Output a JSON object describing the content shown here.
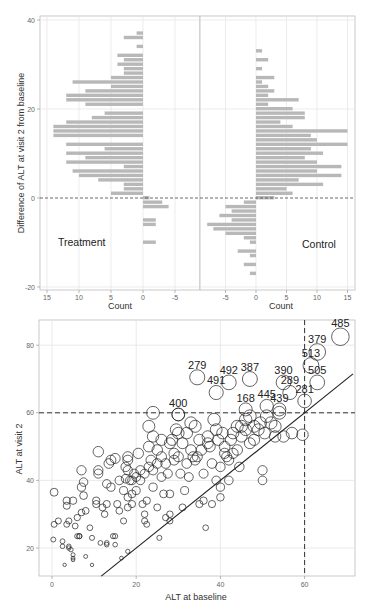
{
  "chart_data": [
    {
      "type": "bar",
      "orientation": "horizontal",
      "title": "",
      "panel_label": "Treatment",
      "xlabel": "Count",
      "ylabel": "Difference of ALT at visit 2 from baseline",
      "x_reversed": true,
      "xlim": [
        16,
        -8.5
      ],
      "ylim": [
        -20.5,
        41
      ],
      "xticks": [
        "15",
        "10",
        "5",
        "0",
        "-5"
      ],
      "yticks": [
        "-20",
        "0",
        "20",
        "40"
      ],
      "reference_line": {
        "y": 0,
        "style": "dashed"
      },
      "bins": [
        37,
        36,
        34,
        32,
        31,
        30,
        29,
        28,
        27,
        26,
        25,
        24,
        23,
        22,
        21,
        19,
        18,
        17,
        16,
        15,
        14,
        12,
        11,
        10,
        9,
        8,
        7,
        6,
        5,
        4,
        3,
        2,
        1,
        0,
        -1,
        -2,
        -5,
        -6,
        -10
      ],
      "values": [
        1,
        3,
        1,
        4,
        3,
        4,
        3,
        3,
        5,
        11,
        5,
        9,
        12,
        12,
        9,
        6,
        8,
        12,
        14,
        14,
        14,
        12,
        6,
        12,
        9,
        12,
        3,
        11,
        10,
        7,
        3,
        3,
        5,
        -1,
        -3,
        -4,
        -2,
        -2,
        -2
      ]
    },
    {
      "type": "bar",
      "orientation": "horizontal",
      "title": "",
      "panel_label": "Control",
      "xlabel": "Count",
      "ylabel": "",
      "xlim": [
        -9,
        16
      ],
      "ylim": [
        -20.5,
        41
      ],
      "xticks": [
        "-5",
        "0",
        "5",
        "10",
        "15"
      ],
      "reference_line": {
        "y": 0,
        "style": "dashed"
      },
      "bins": [
        33,
        31,
        29,
        27,
        26,
        25,
        24,
        23,
        22,
        21,
        20,
        19,
        18,
        17,
        16,
        15,
        14,
        13,
        12,
        11,
        10,
        9,
        8,
        7,
        6,
        5,
        4,
        3,
        2,
        1,
        0,
        -1,
        -2,
        -3,
        -4,
        -5,
        -6,
        -7,
        -8,
        -9,
        -10,
        -12,
        -13,
        -15,
        -17
      ],
      "values": [
        1,
        2,
        1,
        3,
        1,
        2,
        3,
        2,
        7,
        2,
        6,
        8,
        8,
        4,
        6,
        15,
        9,
        10,
        15,
        9,
        11,
        8,
        10,
        14,
        10,
        14,
        7,
        11,
        5,
        6,
        3,
        -2,
        -5,
        -4,
        -6,
        -4,
        -8,
        -7,
        -5,
        -2,
        -1,
        -3,
        -1,
        -2,
        -1
      ]
    },
    {
      "type": "scatter",
      "title": "",
      "xlabel": "ALT at baseline",
      "ylabel": "ALT at visit 2",
      "xlim": [
        -3,
        72
      ],
      "ylim": [
        11,
        87
      ],
      "xticks": [
        "0",
        "20",
        "40",
        "60"
      ],
      "yticks": [
        "20",
        "40",
        "60",
        "80"
      ],
      "grid": true,
      "marker": "open-circle, size proportional to ALT at visit 2",
      "reference_lines": [
        {
          "type": "hline",
          "y": 60,
          "style": "dashed"
        },
        {
          "type": "vline",
          "x": 60,
          "style": "dashed"
        },
        {
          "type": "abline",
          "slope": 1,
          "intercept": 0,
          "style": "solid"
        }
      ],
      "labeled_points": [
        {
          "id": "485",
          "x": 68.5,
          "y": 82.5
        },
        {
          "id": "379",
          "x": 63,
          "y": 78
        },
        {
          "id": "513",
          "x": 61.5,
          "y": 74
        },
        {
          "id": "505",
          "x": 63,
          "y": 69
        },
        {
          "id": "390",
          "x": 55,
          "y": 69
        },
        {
          "id": "387",
          "x": 47,
          "y": 70
        },
        {
          "id": "492",
          "x": 42,
          "y": 69
        },
        {
          "id": "279",
          "x": 34.5,
          "y": 70.5
        },
        {
          "id": "491",
          "x": 39,
          "y": 66
        },
        {
          "id": "289",
          "x": 56.5,
          "y": 66
        },
        {
          "id": "281",
          "x": 60,
          "y": 63.5
        },
        {
          "id": "400",
          "x": 30,
          "y": 59.5
        },
        {
          "id": "168",
          "x": 46,
          "y": 61
        },
        {
          "id": "439",
          "x": 54,
          "y": 61
        },
        {
          "id": "445",
          "x": 51,
          "y": 62
        }
      ],
      "points": [
        [
          0.5,
          36.5
        ],
        [
          0.5,
          27
        ],
        [
          0.3,
          22.5
        ],
        [
          1.5,
          28
        ],
        [
          2.5,
          20.5
        ],
        [
          2.5,
          22
        ],
        [
          3,
          15
        ],
        [
          3.5,
          34
        ],
        [
          3.5,
          32.5
        ],
        [
          3.5,
          27
        ],
        [
          4,
          28
        ],
        [
          4,
          20.5
        ],
        [
          4,
          20
        ],
        [
          4.5,
          19.5
        ],
        [
          5,
          34
        ],
        [
          5,
          18
        ],
        [
          5,
          16.5
        ],
        [
          5,
          17
        ],
        [
          5.5,
          26.5
        ],
        [
          6,
          23.5
        ],
        [
          6,
          29
        ],
        [
          6.5,
          23.5
        ],
        [
          6.5,
          23.5
        ],
        [
          7,
          38
        ],
        [
          7,
          43
        ],
        [
          7,
          30.5
        ],
        [
          7.5,
          39.5
        ],
        [
          7.5,
          35.5
        ],
        [
          8,
          31
        ],
        [
          8,
          17.5
        ],
        [
          9,
          26
        ],
        [
          9.5,
          23
        ],
        [
          9.5,
          15
        ],
        [
          10.5,
          33
        ],
        [
          10.5,
          34
        ],
        [
          11,
          43
        ],
        [
          11,
          42
        ],
        [
          11,
          48.5
        ],
        [
          11.5,
          21.5
        ],
        [
          12,
          32
        ],
        [
          12.5,
          30
        ],
        [
          13,
          21.5
        ],
        [
          13,
          21
        ],
        [
          13,
          33
        ],
        [
          13,
          39
        ],
        [
          13.5,
          45
        ],
        [
          14,
          46
        ],
        [
          14,
          38
        ],
        [
          14.5,
          23.5
        ],
        [
          15,
          21
        ],
        [
          15,
          46.5
        ],
        [
          15,
          23.5
        ],
        [
          15.5,
          33
        ],
        [
          16,
          40
        ],
        [
          16,
          31
        ],
        [
          16.5,
          17
        ],
        [
          17,
          37
        ],
        [
          17,
          28
        ],
        [
          17.5,
          40.5
        ],
        [
          17.5,
          44
        ],
        [
          18,
          46
        ],
        [
          18,
          47
        ],
        [
          18,
          43
        ],
        [
          18,
          19
        ],
        [
          18,
          35
        ],
        [
          18,
          32
        ],
        [
          18.5,
          40
        ],
        [
          19,
          40
        ],
        [
          19,
          36
        ],
        [
          19,
          33
        ],
        [
          19.5,
          42
        ],
        [
          20,
          41
        ],
        [
          20,
          37
        ],
        [
          20.5,
          48
        ],
        [
          21,
          40
        ],
        [
          21,
          43
        ],
        [
          21.5,
          33
        ],
        [
          22,
          42
        ],
        [
          22,
          28
        ],
        [
          22,
          30
        ],
        [
          22.5,
          34
        ],
        [
          22.5,
          27
        ],
        [
          23,
          56
        ],
        [
          23,
          50
        ],
        [
          23,
          44
        ],
        [
          23.5,
          46
        ],
        [
          24,
          60
        ],
        [
          24,
          53
        ],
        [
          24,
          38
        ],
        [
          24,
          43
        ],
        [
          25,
          49
        ],
        [
          25,
          45
        ],
        [
          25,
          32
        ],
        [
          25.5,
          23
        ],
        [
          26,
          41
        ],
        [
          26,
          52
        ],
        [
          26,
          47
        ],
        [
          26.5,
          36
        ],
        [
          27,
          29
        ],
        [
          27,
          45
        ],
        [
          27.5,
          42
        ],
        [
          28,
          51
        ],
        [
          28,
          36
        ],
        [
          28,
          30
        ],
        [
          28,
          28
        ],
        [
          28.5,
          52
        ],
        [
          29,
          46
        ],
        [
          29,
          48
        ],
        [
          29.5,
          55
        ],
        [
          30,
          59.5
        ],
        [
          30,
          54
        ],
        [
          30,
          47
        ],
        [
          30.5,
          42
        ],
        [
          31,
          32
        ],
        [
          31,
          51
        ],
        [
          31.5,
          37
        ],
        [
          32,
          54
        ],
        [
          32,
          45
        ],
        [
          32.5,
          41
        ],
        [
          33,
          57
        ],
        [
          33,
          49
        ],
        [
          33.5,
          47
        ],
        [
          34,
          56
        ],
        [
          34,
          46
        ],
        [
          34.5,
          47
        ],
        [
          35,
          52
        ],
        [
          35,
          33
        ],
        [
          35.5,
          49
        ],
        [
          36,
          42
        ],
        [
          36,
          34
        ],
        [
          36.5,
          26
        ],
        [
          37,
          51
        ],
        [
          37,
          53
        ],
        [
          37.5,
          50
        ],
        [
          38,
          45
        ],
        [
          38,
          33
        ],
        [
          38.5,
          58
        ],
        [
          39,
          55
        ],
        [
          39,
          40
        ],
        [
          39.5,
          52
        ],
        [
          40,
          44
        ],
        [
          40,
          38
        ],
        [
          40,
          35
        ],
        [
          40.5,
          54
        ],
        [
          41,
          48
        ],
        [
          41,
          50
        ],
        [
          41.5,
          47
        ],
        [
          42,
          46
        ],
        [
          42,
          40
        ],
        [
          42.5,
          52
        ],
        [
          43,
          54
        ],
        [
          43,
          48
        ],
        [
          44,
          56
        ],
        [
          44,
          49
        ],
        [
          44.5,
          44
        ],
        [
          45,
          56
        ],
        [
          45,
          53
        ],
        [
          46,
          58
        ],
        [
          46,
          55
        ],
        [
          47,
          51
        ],
        [
          47,
          59
        ],
        [
          48,
          56
        ],
        [
          48,
          52
        ],
        [
          49,
          55
        ],
        [
          49.5,
          57
        ],
        [
          50,
          43
        ],
        [
          50,
          40
        ],
        [
          50.5,
          54
        ],
        [
          51,
          59
        ],
        [
          52,
          57
        ],
        [
          53,
          56
        ],
        [
          53,
          53
        ],
        [
          54,
          60
        ],
        [
          55,
          53
        ],
        [
          57,
          54
        ],
        [
          59.5,
          53.5
        ]
      ]
    }
  ]
}
